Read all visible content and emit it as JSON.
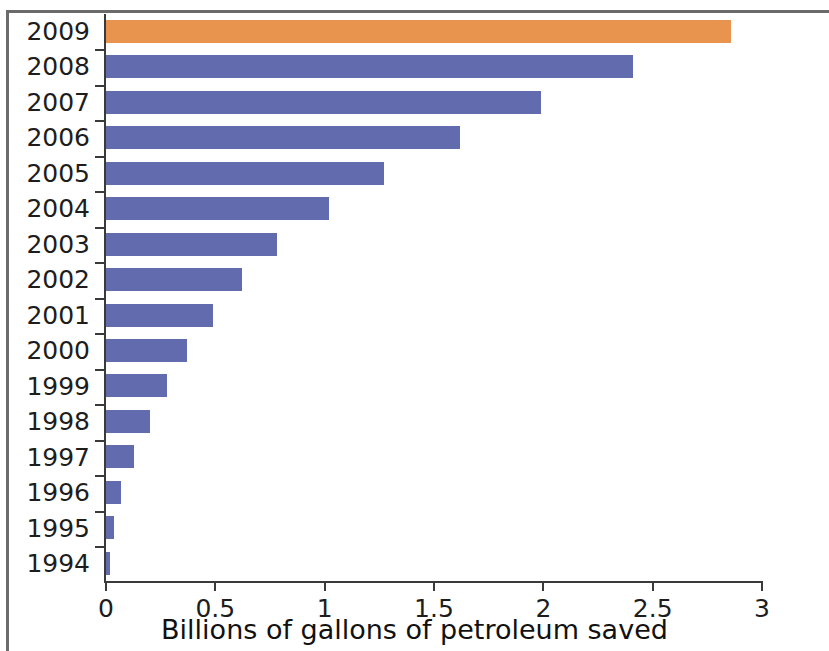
{
  "chart_data": {
    "type": "bar",
    "orientation": "horizontal",
    "title": "",
    "xlabel": "Billions of gallons of petroleum saved",
    "ylabel": "",
    "categories": [
      "2009",
      "2008",
      "2007",
      "2006",
      "2005",
      "2004",
      "2003",
      "2002",
      "2001",
      "2000",
      "1999",
      "1998",
      "1997",
      "1996",
      "1995",
      "1994"
    ],
    "values": [
      2.86,
      2.41,
      1.99,
      1.62,
      1.27,
      1.02,
      0.78,
      0.62,
      0.49,
      0.37,
      0.28,
      0.2,
      0.13,
      0.07,
      0.035,
      0.02
    ],
    "xlim": [
      0,
      3
    ],
    "xticks": [
      0,
      0.5,
      1,
      1.5,
      2,
      2.5,
      3
    ],
    "xticklabels": [
      "0",
      "0.5",
      "1",
      "1.5",
      "2",
      "2.5",
      "3"
    ],
    "grid": false,
    "legend": null,
    "bar_colors": {
      "default": "#626bad",
      "highlight": "#e8944e"
    },
    "highlighted_categories": [
      "2009"
    ]
  },
  "axis": {
    "x_title": "Billions of gallons of petroleum saved"
  }
}
